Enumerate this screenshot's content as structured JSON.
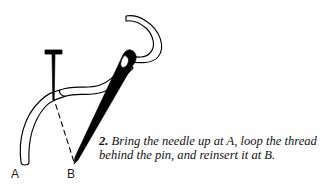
{
  "figure": {
    "name": "pin-stitch-step-2-diagram",
    "background_color": "#ffffff",
    "ink_color": "#000000",
    "labels": {
      "point_a": "A",
      "point_b": "B"
    },
    "caption": {
      "number": "2.",
      "text": "Bring the needle up at A, loop the thread behind the pin, and reinsert it at B.",
      "line1": "Bring the needle up at A, loop the",
      "line2": "thread behind the pin, and reinsert it",
      "line3": "at B."
    },
    "elements": {
      "pin": "sewing-pin-vertical-with-flat-head",
      "needle": "sewing-needle-diagonal-with-eye",
      "thread": "double-outline-thread-loop",
      "dashed_line": "dashed-guide-line-pin-to-b"
    }
  }
}
